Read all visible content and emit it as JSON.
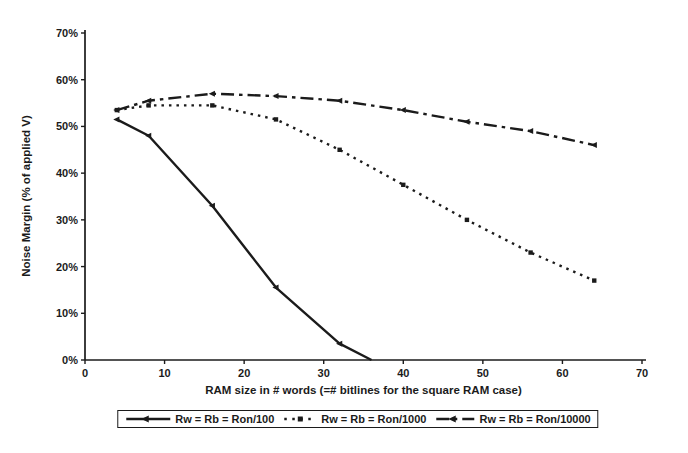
{
  "chart_data": {
    "type": "line",
    "title": "",
    "xlabel": "RAM size in # words (=# bitlines for the square RAM case)",
    "ylabel": "Noise Margin (% of applied V)",
    "xlim": [
      0,
      70
    ],
    "ylim": [
      0,
      70
    ],
    "x_ticks": [
      "0",
      "10",
      "20",
      "30",
      "40",
      "50",
      "60",
      "70"
    ],
    "y_ticks": [
      "0%",
      "10%",
      "20%",
      "30%",
      "40%",
      "50%",
      "60%",
      "70%"
    ],
    "grid": false,
    "legend_position": "bottom-center-boxed",
    "ink_color": "#1b1b1b",
    "background_color": "#ffffff",
    "series": [
      {
        "name": "Rw = Rb = Ron/100",
        "line_style": "solid",
        "marker": "left-triangle",
        "color": "#1b1b1b",
        "points": [
          [
            4,
            51.5
          ],
          [
            8,
            48
          ],
          [
            16,
            33
          ],
          [
            24,
            15.5
          ],
          [
            32,
            3.5
          ],
          [
            36,
            0
          ]
        ]
      },
      {
        "name": "Rw = Rb = Ron/1000",
        "line_style": "dotted",
        "marker": "square",
        "color": "#1b1b1b",
        "points": [
          [
            4,
            53.5
          ],
          [
            8,
            54.5
          ],
          [
            16,
            54.5
          ],
          [
            24,
            51.5
          ],
          [
            32,
            45
          ],
          [
            40,
            37.5
          ],
          [
            48,
            30
          ],
          [
            56,
            23
          ],
          [
            64,
            17
          ]
        ]
      },
      {
        "name": "Rw = Rb = Ron/10000",
        "line_style": "dash-dot",
        "marker": "left-triangle",
        "color": "#1b1b1b",
        "points": [
          [
            4,
            53.5
          ],
          [
            8,
            55.5
          ],
          [
            16,
            57
          ],
          [
            24,
            56.5
          ],
          [
            32,
            55.5
          ],
          [
            40,
            53.5
          ],
          [
            48,
            51
          ],
          [
            56,
            49
          ],
          [
            64,
            46
          ]
        ]
      }
    ]
  }
}
